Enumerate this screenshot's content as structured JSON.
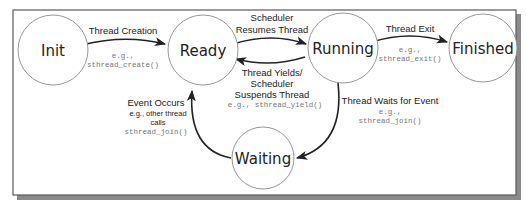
{
  "diagram": {
    "type": "state-machine",
    "colors": {
      "border": "#5a5a5a",
      "shadow": "#8a8a8a",
      "circle_stroke": "#8c8c8c",
      "arrow": "#222222",
      "code_text": "#777777"
    },
    "states": [
      {
        "id": "init",
        "label": "Init"
      },
      {
        "id": "ready",
        "label": "Ready"
      },
      {
        "id": "running",
        "label": "Running"
      },
      {
        "id": "finished",
        "label": "Finished"
      },
      {
        "id": "waiting",
        "label": "Waiting"
      }
    ],
    "transitions": [
      {
        "from": "init",
        "to": "ready",
        "label": "Thread Creation",
        "example_prefix": "e.g.,",
        "example": "sthread_create()"
      },
      {
        "from": "ready",
        "to": "running",
        "label_line1": "Scheduler",
        "label_line2": "Resumes Thread"
      },
      {
        "from": "running",
        "to": "ready",
        "label_line1": "Thread Yields/",
        "label_line2": "Scheduler",
        "label_line3": "Suspends Thread",
        "example": "e.g., sthread_yield()"
      },
      {
        "from": "running",
        "to": "finished",
        "label": "Thread Exit",
        "example_prefix": "e.g.,",
        "example": "sthread_exit()"
      },
      {
        "from": "running",
        "to": "waiting",
        "label": "Thread Waits for Event",
        "example_prefix": "e.g.,",
        "example": "sthread_join()"
      },
      {
        "from": "waiting",
        "to": "ready",
        "label": "Event Occurs",
        "detail_line1": "e.g., other thread",
        "detail_line2": "calls",
        "example": "sthread_join()"
      }
    ]
  }
}
